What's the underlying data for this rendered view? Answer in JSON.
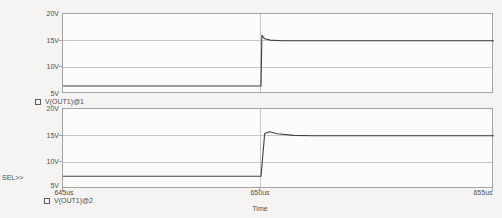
{
  "app": {
    "title": "PSpice Probe transient comparison plot"
  },
  "colors": {
    "background": "#f5f4f2",
    "plot_background": "#fcfcfb",
    "frame": "#a3a3a3",
    "grid": "#c6c6c4",
    "trace": "#3f3f3f",
    "text": "#4f4f4f"
  },
  "x_axis": {
    "label": "Time",
    "ticks": [
      "645us",
      "650us",
      "655us"
    ]
  },
  "panels": [
    {
      "yticks": [
        "20V",
        "15V",
        "10V",
        "5V"
      ],
      "legend": "V(OUT1)@1",
      "legend_marker": "square"
    },
    {
      "yticks": [
        "20V",
        "15V",
        "10V",
        "5V"
      ],
      "legend": "V(OUT1)@2",
      "legend_marker": "square",
      "sel_label": "SEL>>"
    }
  ],
  "chart_data": [
    {
      "type": "line",
      "name": "V(OUT1)@1",
      "panel": "top",
      "xlabel": "Time",
      "xunit": "us",
      "yunit": "V",
      "xlim": [
        645,
        655
      ],
      "ylim": [
        5,
        20
      ],
      "xtick_values": [
        645,
        650,
        655
      ],
      "ytick_values": [
        5,
        10,
        15,
        20
      ],
      "description": "Flat at ~6.5V until 650us, sharp step with ~16V overshoot spike, settles to 15V",
      "x": [
        645,
        650,
        650.02,
        650.08,
        650.2,
        650.45,
        655
      ],
      "y": [
        6.5,
        6.5,
        16.0,
        15.35,
        15.1,
        15.0,
        15.0
      ]
    },
    {
      "type": "line",
      "name": "V(OUT1)@2",
      "panel": "bottom",
      "xlabel": "Time",
      "xunit": "us",
      "yunit": "V",
      "xlim": [
        645,
        655
      ],
      "ylim": [
        5,
        20
      ],
      "xtick_values": [
        645,
        650,
        655
      ],
      "ytick_values": [
        5,
        10,
        15,
        20
      ],
      "description": "Flat at ~7.4V until 650us, step with rounded ~15.8V overshoot, settles to 15V",
      "x": [
        645,
        650,
        650.08,
        650.18,
        650.35,
        650.7,
        651.1,
        655
      ],
      "y": [
        7.4,
        7.4,
        15.4,
        15.75,
        15.35,
        15.05,
        15.0,
        15.0
      ]
    }
  ]
}
